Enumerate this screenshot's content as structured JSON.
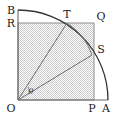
{
  "figure": {
    "background_color": "#ffffff",
    "stroke_color": "#555555",
    "arc_color": "#2b2b2b",
    "shade_fill": "#d8d8d8",
    "label_color": "#1a1a1a",
    "labels": {
      "B": "B",
      "R": "R",
      "T": "T",
      "Q": "Q",
      "S": "S",
      "O": "O",
      "P": "P",
      "A": "A",
      "theta": "θ"
    },
    "points": {
      "O": {
        "x": 18,
        "y": 100
      },
      "A": {
        "x": 108,
        "y": 100
      },
      "B": {
        "x": 18,
        "y": 10
      },
      "P": {
        "x": 94,
        "y": 100
      },
      "Q": {
        "x": 94,
        "y": 23
      },
      "R": {
        "x": 18,
        "y": 23
      },
      "T": {
        "x": 67,
        "y": 23
      },
      "S": {
        "x": 92,
        "y": 55
      }
    },
    "radii": {
      "outer": 90,
      "inner": 62
    },
    "segments": [
      {
        "name": "OT",
        "from": "O",
        "to": "T"
      },
      {
        "name": "OS",
        "from": "O",
        "to": "S"
      },
      {
        "name": "TS-chord-region",
        "from": "T",
        "to": "S"
      }
    ],
    "arcs": [
      {
        "name": "quarter-circle-BA",
        "from": "B",
        "to": "A",
        "center": "O",
        "radius": 90
      },
      {
        "name": "inner-arc-TS",
        "from": "T",
        "to": "S",
        "center": "O",
        "radius": 62
      }
    ],
    "angle_marker": {
      "name": "theta",
      "vertex": "O",
      "between": [
        "OS",
        "OT"
      ]
    }
  }
}
